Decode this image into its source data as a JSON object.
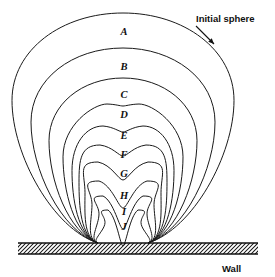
{
  "figure": {
    "background_color": "#ffffff",
    "line_color": "#1a1a1a",
    "width": 275,
    "height": 277
  },
  "annotations": {
    "initial_sphere": {
      "label": "Initial sphere",
      "x": 196,
      "y": 22,
      "pointer_from": [
        196,
        26
      ],
      "pointer_to": [
        214,
        44
      ]
    },
    "wall": {
      "label": "Wall",
      "x": 222,
      "y": 272
    }
  },
  "wall_surface": {
    "y": 243,
    "x_start": 18,
    "x_end": 258,
    "hatch_height": 11,
    "hatch_spacing": 4,
    "hatch_angle_deg": 45
  },
  "contact_points": {
    "left_x": 98,
    "right_x": 148,
    "y": 243
  },
  "stages": [
    {
      "id": "A",
      "label": "A",
      "label_x": 124,
      "label_y": 35,
      "top_y": 13,
      "half_width": 111,
      "dimple_depth": 0,
      "dimple_width": 0,
      "neck_x": 0
    },
    {
      "id": "B",
      "label": "B",
      "label_x": 124,
      "label_y": 70,
      "top_y": 48,
      "half_width": 92,
      "dimple_depth": 0,
      "dimple_width": 0,
      "neck_x": 0
    },
    {
      "id": "C",
      "label": "C",
      "label_x": 124,
      "label_y": 98,
      "top_y": 78,
      "half_width": 74,
      "dimple_depth": 0,
      "dimple_width": 0,
      "neck_x": 0
    },
    {
      "id": "D",
      "label": "D",
      "label_x": 124,
      "label_y": 118,
      "top_y": 104,
      "half_width": 60,
      "dimple_depth": 2,
      "dimple_width": 16,
      "neck_x": 0
    },
    {
      "id": "E",
      "label": "E",
      "label_x": 124,
      "label_y": 139,
      "top_y": 126,
      "half_width": 51,
      "dimple_depth": 6,
      "dimple_width": 20,
      "neck_x": 0
    },
    {
      "id": "F",
      "label": "F",
      "label_x": 124,
      "label_y": 158,
      "top_y": 145,
      "half_width": 44,
      "dimple_depth": 11,
      "dimple_width": 23,
      "neck_x": 0
    },
    {
      "id": "G",
      "label": "G",
      "label_x": 124,
      "label_y": 177,
      "top_y": 162,
      "half_width": 38,
      "dimple_depth": 18,
      "dimple_width": 25,
      "neck_x": 0
    },
    {
      "id": "H",
      "label": "H",
      "label_x": 124,
      "label_y": 199,
      "top_y": 181,
      "half_width": 31,
      "dimple_depth": 27,
      "dimple_width": 24,
      "neck_x": 0
    },
    {
      "id": "I",
      "label": "I",
      "label_x": 124,
      "label_y": 215,
      "top_y": 196,
      "half_width": 24,
      "dimple_depth": 33,
      "dimple_width": 20,
      "neck_x": 0
    },
    {
      "id": "J",
      "label": "J",
      "label_x": 124,
      "label_y": 230,
      "top_y": 210,
      "half_width": 18,
      "dimple_depth": 36,
      "dimple_width": 15,
      "neck_x": 0
    }
  ]
}
